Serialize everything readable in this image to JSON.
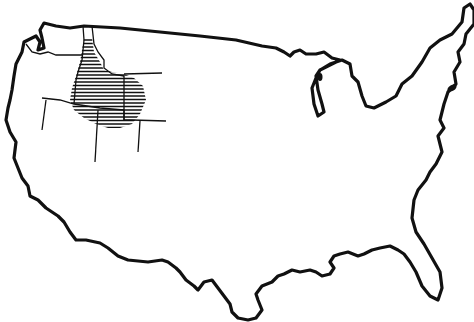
{
  "map": {
    "subject": "Outline map of the contiguous United States",
    "highlighted_region": {
      "name": "Idaho and surrounding area",
      "style": "horizontal hatching",
      "color": "#111111"
    },
    "background_color": "#ffffff",
    "outline_color": "#111111"
  }
}
